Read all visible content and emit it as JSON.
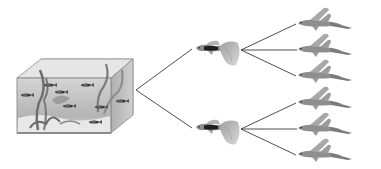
{
  "diagram": {
    "type": "breeding-tree",
    "colors": {
      "background": "#ffffff",
      "line": "#3a3a3a",
      "tank_glass": "#c9c9c9",
      "tank_edge": "#8a8a8a",
      "water": "#bdbdbd",
      "fish_dark": "#1e1e1e",
      "fish_body": "#9a9a9a",
      "fish_fin": "#b8b8b8"
    },
    "nodes": {
      "aquarium": {
        "name": "aquarium",
        "icon": "aquarium-icon",
        "fish_count": 8
      },
      "parents": [
        {
          "name": "parent-guppy-1",
          "icon": "guppy-icon"
        },
        {
          "name": "parent-guppy-2",
          "icon": "guppy-icon"
        }
      ],
      "offspring": [
        {
          "name": "offspring-1",
          "parent": 1,
          "icon": "fish-icon"
        },
        {
          "name": "offspring-2",
          "parent": 1,
          "icon": "fish-icon"
        },
        {
          "name": "offspring-3",
          "parent": 1,
          "icon": "fish-icon"
        },
        {
          "name": "offspring-4",
          "parent": 2,
          "icon": "fish-icon"
        },
        {
          "name": "offspring-5",
          "parent": 2,
          "icon": "fish-icon"
        },
        {
          "name": "offspring-6",
          "parent": 2,
          "icon": "fish-icon"
        }
      ]
    },
    "edges": [
      {
        "from": "aquarium",
        "to": "parent-guppy-1"
      },
      {
        "from": "aquarium",
        "to": "parent-guppy-2"
      },
      {
        "from": "parent-guppy-1",
        "to": "offspring-1"
      },
      {
        "from": "parent-guppy-1",
        "to": "offspring-2"
      },
      {
        "from": "parent-guppy-1",
        "to": "offspring-3"
      },
      {
        "from": "parent-guppy-2",
        "to": "offspring-4"
      },
      {
        "from": "parent-guppy-2",
        "to": "offspring-5"
      },
      {
        "from": "parent-guppy-2",
        "to": "offspring-6"
      }
    ]
  }
}
